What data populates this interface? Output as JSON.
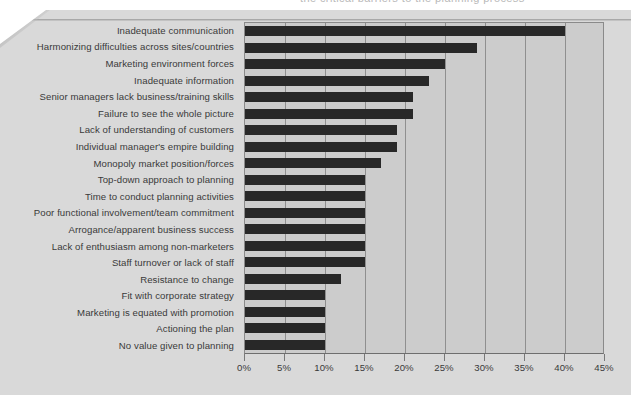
{
  "page": {
    "cut_off_text_above": "the critical barriers to the planning process",
    "background_color": "#d9d9d9",
    "bar_color": "#282828",
    "plot_background_color": "#cccccc",
    "gridline_color": "#8f8f8f"
  },
  "chart_data": {
    "type": "bar",
    "orientation": "horizontal",
    "title": "",
    "xlabel": "",
    "ylabel": "",
    "xlim": [
      0,
      45
    ],
    "xticks": [
      0,
      5,
      10,
      15,
      20,
      25,
      30,
      35,
      40,
      45
    ],
    "xtick_labels": [
      "0%",
      "5%",
      "10%",
      "15%",
      "20%",
      "25%",
      "30%",
      "35%",
      "40%",
      "45%"
    ],
    "grid": true,
    "grid_axis": "x",
    "legend": false,
    "categories": [
      "Inadequate communication",
      "Harmonizing difficulties across sites/countries",
      "Marketing environment forces",
      "Inadequate information",
      "Senior managers lack business/training skills",
      "Failure to see the whole picture",
      "Lack of understanding of customers",
      "Individual manager's empire building",
      "Monopoly market position/forces",
      "Top-down approach to planning",
      "Time to conduct planning activities",
      "Poor functional involvement/team commitment",
      "Arrogance/apparent business success",
      "Lack of enthusiasm among non-marketers",
      "Staff turnover or lack of staff",
      "Resistance to change",
      "Fit with corporate strategy",
      "Marketing is equated with promotion",
      "Actioning the plan",
      "No value given to planning"
    ],
    "values": [
      40,
      29,
      25,
      23,
      21,
      21,
      19,
      19,
      17,
      15,
      15,
      15,
      15,
      15,
      15,
      12,
      10,
      10,
      10,
      10
    ],
    "value_unit": "%"
  }
}
